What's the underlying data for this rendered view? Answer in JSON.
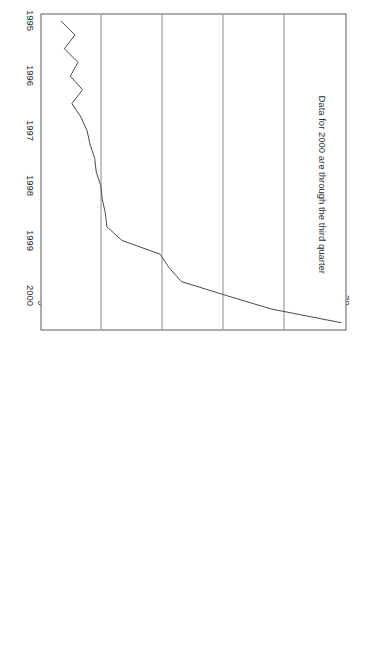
{
  "figure": {
    "orientation_deg": 90,
    "annotation": "Data for 2000 are through the third quarter",
    "ylabel": "Billions of dollars quarterly",
    "xlabel": "",
    "line_color": "#4a4a4a",
    "grid_color": "#8c8c8c",
    "frame_color": "#5a5a5a",
    "text_color": "#2b2b2b",
    "background": "#ffffff"
  },
  "chart_data": {
    "type": "line",
    "title": "",
    "xlabel": "",
    "ylabel": "Billions of dollars quarterly",
    "annotations": [
      "Data for 2000 are through the third quarter"
    ],
    "grid": true,
    "grid_axis": "y",
    "legend": "none",
    "xlim": [
      1994.875,
      2000.625
    ],
    "ylim": [
      0,
      20
    ],
    "yticks": [
      0,
      4,
      8,
      12,
      16,
      20
    ],
    "ytick_labels": [
      "0",
      "4",
      "8",
      "12",
      "16",
      "20"
    ],
    "xticks": [
      1995,
      1996,
      1997,
      1998,
      1999,
      2000
    ],
    "xtick_labels": [
      "1995",
      "1996",
      "1997",
      "1998",
      "1999",
      "2000"
    ],
    "x": [
      1995.0,
      1995.25,
      1995.5,
      1995.75,
      1996.0,
      1996.25,
      1996.5,
      1996.75,
      1997.0,
      1997.25,
      1997.5,
      1997.75,
      1998.0,
      1998.25,
      1998.5,
      1998.75,
      1999.0,
      1999.25,
      1999.5,
      1999.75,
      2000.0,
      2000.25,
      2000.5
    ],
    "x_quarter_labels": [
      "1995 Q1",
      "1995 Q2",
      "1995 Q3",
      "1995 Q4",
      "1996 Q1",
      "1996 Q2",
      "1996 Q3",
      "1996 Q4",
      "1997 Q1",
      "1997 Q2",
      "1997 Q3",
      "1997 Q4",
      "1998 Q1",
      "1998 Q2",
      "1998 Q3",
      "1998 Q4",
      "1999 Q1",
      "1999 Q2",
      "1999 Q3",
      "1999 Q4",
      "2000 Q1",
      "2000 Q2",
      "2000 Q3"
    ],
    "series": [
      {
        "name": "Billions of dollars quarterly",
        "color": "#4a4a4a",
        "values": [
          1.3,
          2.2,
          1.5,
          2.4,
          1.9,
          2.7,
          2.0,
          2.6,
          3.0,
          3.2,
          3.5,
          3.6,
          3.9,
          4.0,
          4.2,
          4.3,
          5.3,
          7.8,
          8.4,
          9.2,
          12.1,
          15.1,
          19.7
        ]
      }
    ],
    "max_value": 19.7,
    "min_value": 1.3
  }
}
